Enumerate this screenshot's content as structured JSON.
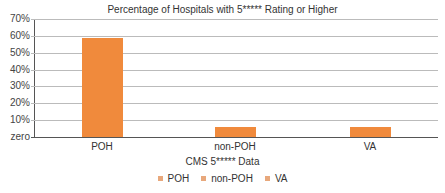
{
  "chart_data": {
    "type": "bar",
    "title": "Percentage of Hospitals with 5***** Rating or Higher",
    "xlabel": "CMS 5***** Data",
    "ylabel": "",
    "categories": [
      "POH",
      "non-POH",
      "VA"
    ],
    "values": [
      58.5,
      6,
      6
    ],
    "unit": "%",
    "ylim": [
      0,
      70
    ],
    "yticks": [
      "zero",
      "10%",
      "20%",
      "30%",
      "40%",
      "50%",
      "60%",
      "70%"
    ],
    "grid": true,
    "legend": {
      "position": "bottom",
      "entries": [
        "POH",
        "non-POH",
        "VA"
      ]
    },
    "colors": {
      "bar": "#F08A3C",
      "legend_swatch": "#E8A87C"
    }
  }
}
